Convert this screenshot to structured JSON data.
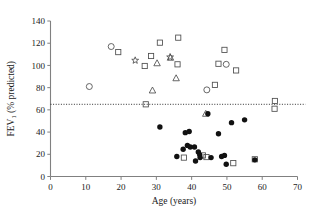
{
  "chart_data": {
    "type": "scatter",
    "title": "",
    "xlabel": "Age (years)",
    "ylabel": "FEV₁ (% predicted)",
    "ylabel_main": "FEV",
    "ylabel_sub": "1",
    "ylabel_rest": " (% predicted)",
    "xlim": [
      0,
      70
    ],
    "ylim": [
      0,
      140
    ],
    "xticks": [
      0,
      10,
      20,
      30,
      40,
      50,
      60,
      70
    ],
    "yticks": [
      0,
      20,
      40,
      60,
      80,
      100,
      120,
      140
    ],
    "grid": false,
    "legend": "none",
    "annotations": [
      {
        "name": "reference-line",
        "type": "hline",
        "y": 65,
        "style": "dotted",
        "label": ""
      }
    ],
    "series": [
      {
        "name": "open-circle",
        "marker": "open-circle",
        "filled": false,
        "points": [
          {
            "x": 11.0,
            "y": 81
          },
          {
            "x": 17.2,
            "y": 117
          },
          {
            "x": 44.3,
            "y": 78
          },
          {
            "x": 49.8,
            "y": 101
          }
        ]
      },
      {
        "name": "open-square",
        "marker": "open-square",
        "filled": false,
        "points": [
          {
            "x": 19.2,
            "y": 112
          },
          {
            "x": 26.7,
            "y": 99.5
          },
          {
            "x": 27.0,
            "y": 65
          },
          {
            "x": 28.5,
            "y": 108.5
          },
          {
            "x": 31.0,
            "y": 120.5
          },
          {
            "x": 36.2,
            "y": 125
          },
          {
            "x": 36.0,
            "y": 101
          },
          {
            "x": 37.8,
            "y": 17
          },
          {
            "x": 43.2,
            "y": 19
          },
          {
            "x": 44.2,
            "y": 17.5
          },
          {
            "x": 46.6,
            "y": 82.5
          },
          {
            "x": 47.6,
            "y": 101.5
          },
          {
            "x": 49.3,
            "y": 114
          },
          {
            "x": 51.8,
            "y": 12
          },
          {
            "x": 52.6,
            "y": 95.5
          },
          {
            "x": 57.9,
            "y": 15.5
          },
          {
            "x": 63.6,
            "y": 68
          },
          {
            "x": 63.5,
            "y": 61
          }
        ]
      },
      {
        "name": "open-triangle",
        "marker": "open-triangle",
        "filled": false,
        "points": [
          {
            "x": 28.9,
            "y": 77.5
          },
          {
            "x": 30.2,
            "y": 102
          },
          {
            "x": 34.0,
            "y": 107
          },
          {
            "x": 35.6,
            "y": 88.5
          },
          {
            "x": 44.0,
            "y": 56.5
          }
        ]
      },
      {
        "name": "open-star",
        "marker": "open-star",
        "filled": false,
        "points": [
          {
            "x": 24.0,
            "y": 104.5
          },
          {
            "x": 33.9,
            "y": 107.5
          }
        ]
      },
      {
        "name": "filled-circle",
        "marker": "filled-circle",
        "filled": true,
        "points": [
          {
            "x": 31.0,
            "y": 44.5
          },
          {
            "x": 35.8,
            "y": 18
          },
          {
            "x": 37.6,
            "y": 24.5
          },
          {
            "x": 38.2,
            "y": 39.5
          },
          {
            "x": 39.3,
            "y": 40.5
          },
          {
            "x": 38.8,
            "y": 28
          },
          {
            "x": 39.6,
            "y": 26.5
          },
          {
            "x": 40.8,
            "y": 26.5
          },
          {
            "x": 41.1,
            "y": 14
          },
          {
            "x": 41.9,
            "y": 22
          },
          {
            "x": 42.3,
            "y": 19.5
          },
          {
            "x": 42.4,
            "y": 17
          },
          {
            "x": 44.6,
            "y": 56.5
          },
          {
            "x": 45.5,
            "y": 17
          },
          {
            "x": 47.6,
            "y": 38.5
          },
          {
            "x": 49.3,
            "y": 19
          },
          {
            "x": 49.8,
            "y": 11
          },
          {
            "x": 48.5,
            "y": 18
          },
          {
            "x": 51.3,
            "y": 48.5
          },
          {
            "x": 55.0,
            "y": 51
          },
          {
            "x": 57.9,
            "y": 15
          }
        ]
      }
    ]
  }
}
